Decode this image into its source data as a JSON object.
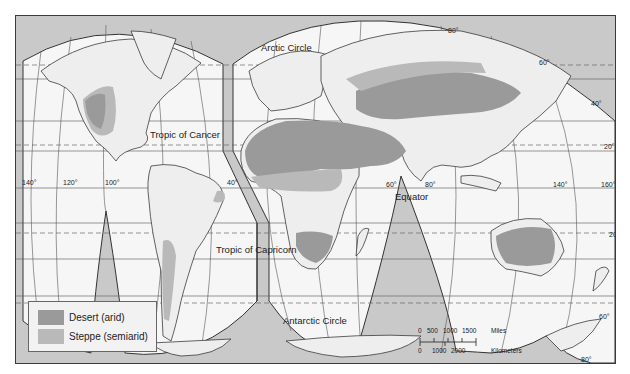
{
  "map": {
    "title": "World desert and steppe regions",
    "projection": "Interrupted (Goode homolosine style)",
    "colors": {
      "ocean_background": "#c9c9c9",
      "land": "#efefef",
      "desert": "#9a9a9a",
      "steppe": "#b9b9b9",
      "lobe_fill": "#f6f6f6",
      "graticule": "#444444"
    },
    "line_labels": {
      "arctic_circle": "Arctic Circle",
      "tropic_of_cancer": "Tropic of Cancer",
      "equator": "Equator",
      "tropic_of_capricorn": "Tropic of Capricorn",
      "antarctic_circle": "Antarctic Circle"
    },
    "longitude_labels": {
      "lon_140w": "140°",
      "lon_120w": "120°",
      "lon_100w": "100°",
      "lon_40w": "40°",
      "lon_60e": "60°",
      "lon_80e": "80°",
      "lon_140e": "140°",
      "lon_160e": "160°"
    },
    "latitude_labels": {
      "lat_80n": "80°",
      "lat_60n": "60°",
      "lat_40n": "40°",
      "lat_20n": "20°",
      "lat_0": "0°",
      "lat_20s": "20°",
      "lat_60s": "60°",
      "lat_80s": "80°"
    }
  },
  "legend": {
    "items": [
      {
        "label": "Desert (arid)",
        "color": "#9a9a9a"
      },
      {
        "label": "Steppe (semiarid)",
        "color": "#b9b9b9"
      }
    ]
  },
  "scale_bar": {
    "miles_ticks": [
      "0",
      "500",
      "1000",
      "1500"
    ],
    "miles_unit": "Miles",
    "km_ticks": [
      "0",
      "1000",
      "2000"
    ],
    "km_unit": "Kilometers"
  }
}
